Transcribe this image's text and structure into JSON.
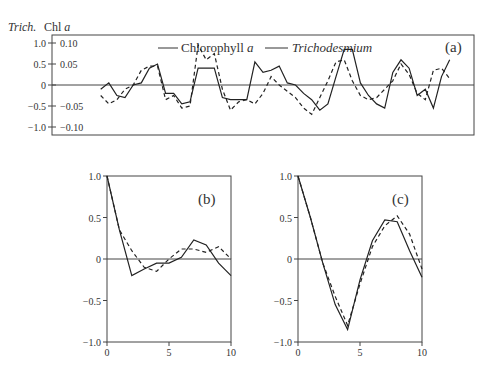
{
  "chart_data": [
    {
      "id": "a",
      "type": "line",
      "panel_label": "(a)",
      "title": "",
      "ylabel_left": "Trich.",
      "ylabel_right_of_left": "Chl a",
      "left_ticks": [
        "1.0",
        "0.5",
        "0",
        "-0.5",
        "-1.0"
      ],
      "inner_ticks": [
        "0.10",
        "0.05",
        "",
        "-0.05",
        "-0.10"
      ],
      "ylim": [
        -1.0,
        1.0
      ],
      "legend": [
        {
          "name": "Chlorophyll a",
          "style": "dashed"
        },
        {
          "name": "Trichodesmium",
          "style": "solid"
        }
      ],
      "x": [
        0,
        1,
        2,
        3,
        4,
        5,
        6,
        7,
        8,
        9,
        10,
        11,
        12,
        13,
        14,
        15,
        16,
        17,
        18,
        19,
        20,
        21,
        22,
        23,
        24,
        25,
        26,
        27,
        28,
        29,
        30,
        31,
        32,
        33,
        34,
        35,
        36,
        37,
        38,
        39,
        40,
        41,
        42,
        43
      ],
      "series": [
        {
          "name": "Trichodesmium",
          "style": "solid",
          "values": [
            -0.1,
            0.05,
            -0.25,
            -0.3,
            0.0,
            0.05,
            0.4,
            0.5,
            -0.2,
            -0.2,
            -0.45,
            -0.4,
            0.4,
            0.4,
            0.4,
            -0.3,
            -0.35,
            -0.35,
            -0.35,
            0.55,
            0.3,
            0.35,
            0.45,
            0.05,
            0.0,
            -0.2,
            -0.35,
            -0.6,
            -0.45,
            0.2,
            0.85,
            0.85,
            0.05,
            -0.25,
            -0.45,
            -0.55,
            0.3,
            0.6,
            0.4,
            -0.25,
            -0.1,
            -0.55,
            0.2,
            0.6
          ]
        },
        {
          "name": "Chlorophyll a",
          "style": "dashed",
          "values": [
            -0.25,
            -0.45,
            -0.35,
            -0.1,
            0.0,
            0.35,
            0.45,
            0.45,
            -0.35,
            -0.25,
            -0.55,
            -0.5,
            0.95,
            0.6,
            0.75,
            -0.1,
            -0.6,
            -0.4,
            -0.35,
            -0.45,
            -0.2,
            0.2,
            0.0,
            -0.15,
            -0.3,
            -0.55,
            -0.7,
            -0.3,
            0.1,
            0.55,
            0.6,
            0.1,
            -0.25,
            -0.35,
            -0.3,
            -0.1,
            0.1,
            0.5,
            0.25,
            -0.2,
            -0.35,
            0.35,
            0.4,
            0.15
          ]
        }
      ]
    },
    {
      "id": "b",
      "type": "line",
      "panel_label": "(b)",
      "xlabel": "",
      "ylabel": "",
      "x_ticks": [
        "0",
        "5",
        "10"
      ],
      "y_ticks": [
        "1.0",
        "0.5",
        "0",
        "-0.5",
        "-1.0"
      ],
      "xlim": [
        0,
        10
      ],
      "ylim": [
        -1.0,
        1.0
      ],
      "x": [
        0,
        1,
        2,
        3,
        4,
        5,
        6,
        7,
        8,
        9,
        10
      ],
      "series": [
        {
          "name": "Trichodesmium",
          "style": "solid",
          "values": [
            1.0,
            0.35,
            -0.2,
            -0.12,
            -0.05,
            -0.05,
            0.02,
            0.23,
            0.17,
            -0.05,
            -0.2
          ]
        },
        {
          "name": "Chlorophyll a",
          "style": "dashed",
          "values": [
            1.0,
            0.35,
            0.1,
            -0.1,
            -0.15,
            0.0,
            0.12,
            0.12,
            0.08,
            0.15,
            0.0
          ]
        }
      ]
    },
    {
      "id": "c",
      "type": "line",
      "panel_label": "(c)",
      "xlabel": "",
      "ylabel": "",
      "x_ticks": [
        "0",
        "5",
        "10"
      ],
      "y_ticks": [
        "1.0",
        "0.5",
        "0",
        "-0.5",
        "-1.0"
      ],
      "xlim": [
        0,
        10
      ],
      "ylim": [
        -1.0,
        1.0
      ],
      "x": [
        0,
        1,
        2,
        3,
        4,
        5,
        6,
        7,
        8,
        9,
        10
      ],
      "series": [
        {
          "name": "Trichodesmium",
          "style": "solid",
          "values": [
            1.0,
            0.5,
            -0.05,
            -0.55,
            -0.85,
            -0.25,
            0.22,
            0.47,
            0.45,
            0.1,
            -0.22
          ]
        },
        {
          "name": "Chlorophyll a",
          "style": "dashed",
          "values": [
            1.0,
            0.5,
            -0.05,
            -0.45,
            -0.8,
            -0.3,
            0.15,
            0.4,
            0.52,
            0.3,
            -0.12
          ]
        }
      ]
    }
  ]
}
